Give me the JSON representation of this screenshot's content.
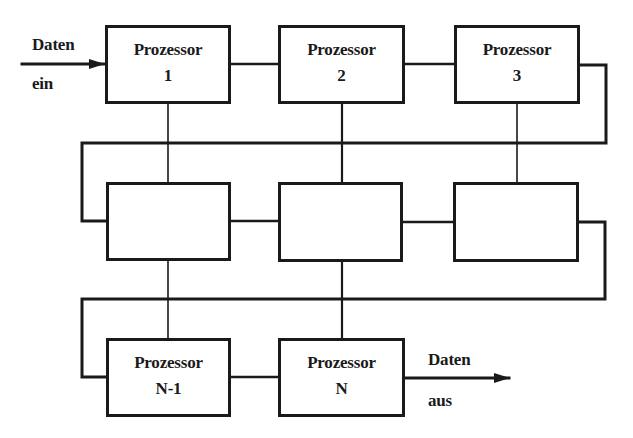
{
  "diagram": {
    "type": "processor-pipeline",
    "line_color": "#1a1a1a",
    "background": "#ffffff",
    "input": {
      "label_top": "Daten",
      "label_bottom": "ein"
    },
    "output": {
      "label_top": "Daten",
      "label_bottom": "aus"
    },
    "rows": [
      {
        "boxes": [
          {
            "title": "Prozessor",
            "index": "1"
          },
          {
            "title": "Prozessor",
            "index": "2"
          },
          {
            "title": "Prozessor",
            "index": "3"
          }
        ]
      },
      {
        "boxes": [
          {
            "title": "",
            "index": ""
          },
          {
            "title": "",
            "index": ""
          },
          {
            "title": "",
            "index": ""
          }
        ]
      },
      {
        "boxes": [
          {
            "title": "Prozessor",
            "index": "N-1"
          },
          {
            "title": "Prozessor",
            "index": "N"
          }
        ]
      }
    ]
  }
}
